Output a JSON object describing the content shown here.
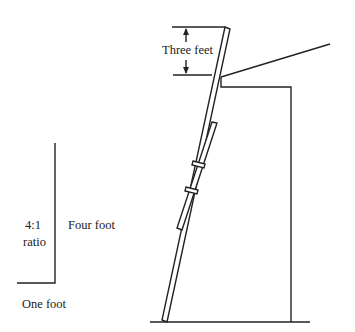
{
  "diagram": {
    "labels": {
      "top_clearance": "Three feet",
      "ratio_line1": "4:1",
      "ratio_line2": "ratio",
      "height": "Four foot",
      "base": "One foot"
    },
    "stroke_color": "#222222"
  }
}
